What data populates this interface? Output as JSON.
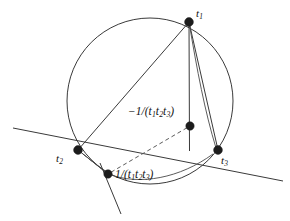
{
  "figure": {
    "background_color": "#ffffff",
    "stroke_color": "#3a3a3a",
    "dot_color": "#1c1c1c",
    "width": 290,
    "height": 221
  },
  "labels": {
    "t1": {
      "base": "t",
      "sub": "1",
      "text": "t1"
    },
    "t2": {
      "base": "t",
      "sub": "2",
      "text": "t2"
    },
    "t3": {
      "base": "t",
      "sub": "3",
      "text": "t3"
    },
    "neg_inverse": {
      "prefix": "−1/(t",
      "sub1": "1",
      "mid1": "t",
      "sub2": "2",
      "mid2": "t",
      "sub3": "3",
      "suffix": ")",
      "text": "−1/(t1t2t3)"
    },
    "pos_inverse": {
      "prefix": "1/(t",
      "sub1": "1",
      "mid1": "t",
      "sub2": "2",
      "mid2": "t",
      "sub3": "3",
      "suffix": ")",
      "text": "1/(t1t2t3)"
    }
  },
  "geometry": {
    "circle": {
      "cx": 150,
      "cy": 101,
      "r": 83
    },
    "points": {
      "t1": {
        "x": 189,
        "y": 22
      },
      "t2": {
        "x": 78,
        "y": 150
      },
      "t3": {
        "x": 218,
        "y": 150
      },
      "neg_inverse": {
        "x": 190,
        "y": 126
      },
      "pos_inverse": {
        "x": 108,
        "y": 174
      }
    },
    "dot_radius": 4.2
  }
}
